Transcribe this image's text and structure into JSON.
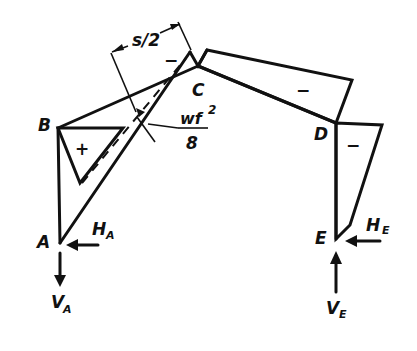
{
  "diagram": {
    "type": "bending-moment-diagram",
    "nodes": {
      "A": {
        "label": "A"
      },
      "B": {
        "label": "B"
      },
      "C": {
        "label": "C"
      },
      "D": {
        "label": "D"
      },
      "E": {
        "label": "E"
      }
    },
    "reactions": {
      "HA": {
        "main": "H",
        "sub": "A"
      },
      "VA": {
        "main": "V",
        "sub": "A"
      },
      "HE": {
        "main": "H",
        "sub": "E"
      },
      "VE": {
        "main": "V",
        "sub": "E"
      }
    },
    "signs": {
      "column_ab": "+",
      "peak_c": "−",
      "rafter_cd": "−",
      "column_de": "−"
    },
    "dimensions": {
      "half_span": "s/2",
      "midspan_moment_num": "wf",
      "midspan_moment_exp": "2",
      "midspan_moment_den": "8"
    },
    "colors": {
      "ink": "#111111",
      "background": "#ffffff"
    }
  }
}
